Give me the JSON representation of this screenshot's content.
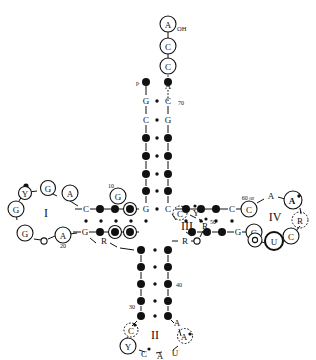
{
  "figure": {
    "type": "trna-cloverleaf-secondary-structure",
    "title": "",
    "background_color": "#ffffff",
    "ink_color": "#111111"
  },
  "legend": {
    "filled_circle_meaning": "invariant/conserved nucleotide",
    "open_circle_meaning": "circled conserved base",
    "dashed_circle_meaning": "semi-conserved base"
  },
  "labels": {
    "terminal_oh": "OH",
    "phosphate_5prime": "p",
    "position_70": "70",
    "position_60_or": "60 or",
    "position_50": "50",
    "position_40": "40",
    "position_30": "30",
    "position_20": "20",
    "position_10": "10"
  },
  "arms": {
    "acceptor_stem": {
      "name": "acceptor-stem",
      "single_strand_3prime": [
        {
          "base": "A",
          "style": "circled",
          "label": "OH"
        },
        {
          "base": "C",
          "style": "circled"
        },
        {
          "base": "C",
          "style": "circled"
        },
        {
          "base": "A",
          "style": "plain"
        }
      ],
      "left_strand_5to3": [
        {
          "base": "p",
          "style": "filled-dot"
        },
        {
          "base": "G",
          "style": "plain"
        },
        {
          "base": "C",
          "style": "plain"
        },
        {
          "base": "",
          "style": "filled-dot"
        },
        {
          "base": "",
          "style": "filled-dot"
        },
        {
          "base": "",
          "style": "filled-dot"
        },
        {
          "base": "",
          "style": "filled-dot"
        },
        {
          "base": "G",
          "style": "plain"
        }
      ],
      "right_strand": [
        {
          "base": "",
          "style": "filled-dot"
        },
        {
          "base": "C",
          "style": "plain",
          "number": "70"
        },
        {
          "base": "G",
          "style": "plain"
        },
        {
          "base": "",
          "style": "filled-dot"
        },
        {
          "base": "",
          "style": "filled-dot"
        },
        {
          "base": "",
          "style": "filled-dot"
        },
        {
          "base": "",
          "style": "filled-dot"
        },
        {
          "base": "C",
          "style": "plain"
        }
      ]
    },
    "d_arm": {
      "name": "d-arm",
      "numeral": "I",
      "top_strand": [
        {
          "base": "C",
          "style": "plain"
        },
        {
          "base": "",
          "style": "filled-dot"
        },
        {
          "base": "",
          "style": "filled-dot"
        },
        {
          "base": "",
          "style": "filled-dot-circled"
        },
        {
          "base": "G",
          "style": "circled",
          "number": "10"
        }
      ],
      "bottom_strand": [
        {
          "base": "G",
          "style": "plain"
        },
        {
          "base": "",
          "style": "filled-dot"
        },
        {
          "base": "",
          "style": "filled-dot"
        },
        {
          "base": "",
          "style": "filled-dot-circled"
        },
        {
          "base": "",
          "style": "filled-dot-circled"
        }
      ],
      "loop": [
        {
          "base": "A",
          "style": "circled"
        },
        {
          "base": "G",
          "style": "circled"
        },
        {
          "base": "",
          "style": "filled-dot"
        },
        {
          "base": "Y",
          "style": "circled"
        },
        {
          "base": "G",
          "style": "circled"
        },
        {
          "base": "G",
          "style": "circled"
        },
        {
          "base": "o",
          "style": "small-open"
        },
        {
          "base": "A",
          "style": "circled",
          "number": "20"
        }
      ]
    },
    "anticodon_arm": {
      "name": "anticodon-arm",
      "numeral": "II",
      "left_strand": [
        {
          "base": "R",
          "style": "plain"
        },
        {
          "base": "",
          "style": "filled-dot"
        },
        {
          "base": "",
          "style": "filled-dot"
        },
        {
          "base": "",
          "style": "filled-dot"
        },
        {
          "base": "",
          "style": "filled-dot"
        },
        {
          "base": "",
          "style": "filled-dot",
          "number": "30"
        }
      ],
      "right_strand": [
        {
          "base": "R",
          "style": "plain"
        },
        {
          "base": "",
          "style": "filled-dot"
        },
        {
          "base": "",
          "style": "filled-dot"
        },
        {
          "base": "",
          "style": "filled-dot",
          "number": "40"
        },
        {
          "base": "",
          "style": "filled-dot"
        },
        {
          "base": "",
          "style": "filled-dot"
        }
      ],
      "loop": [
        {
          "base": "C",
          "style": "dashed-circled-dot"
        },
        {
          "base": "Y",
          "style": "circled"
        },
        {
          "base": "C",
          "style": "plain-dot"
        },
        {
          "base": "A",
          "style": "plain"
        },
        {
          "base": "U",
          "style": "plain"
        },
        {
          "base": "A",
          "style": "dashed-circled-dot"
        },
        {
          "base": "A",
          "style": "plain"
        }
      ]
    },
    "variable_loop": {
      "name": "variable-loop",
      "numeral": "III",
      "bases": [
        {
          "base": "C",
          "style": "dashed-circled-dot"
        },
        {
          "base": "Y",
          "style": "plain-dot"
        },
        {
          "base": "R",
          "style": "plain-dot"
        },
        {
          "base": "R",
          "style": "plain"
        },
        {
          "base": "o",
          "style": "small-open"
        }
      ]
    },
    "t_arm": {
      "name": "t-arm",
      "numeral": "IV",
      "top_strand": [
        {
          "base": "",
          "style": "filled-dot"
        },
        {
          "base": "",
          "style": "filled-dot"
        },
        {
          "base": "",
          "style": "filled-dot"
        },
        {
          "base": "C",
          "style": "plain"
        },
        {
          "base": "C",
          "style": "circled",
          "number": "60 or"
        }
      ],
      "bottom_strand": [
        {
          "base": "",
          "style": "filled-dot"
        },
        {
          "base": "",
          "style": "filled-dot"
        },
        {
          "base": "",
          "style": "filled-dot",
          "number": "50"
        },
        {
          "base": "G",
          "style": "plain"
        },
        {
          "base": "G",
          "style": "circled"
        }
      ],
      "loop": [
        {
          "base": "A",
          "style": "plain"
        },
        {
          "base": "A",
          "style": "circled-dot"
        },
        {
          "base": "R",
          "style": "dashed-circled"
        },
        {
          "base": "C",
          "style": "circled"
        },
        {
          "base": "U",
          "style": "circled-bold"
        },
        {
          "base": "o",
          "style": "circled-small"
        }
      ]
    }
  }
}
